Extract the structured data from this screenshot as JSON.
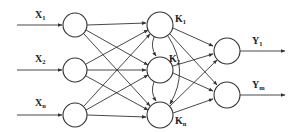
{
  "diagram": {
    "type": "neural-network",
    "colors": {
      "stroke": "#333333",
      "background": "#ffffff",
      "text": "#222222"
    },
    "input_layer": {
      "nodes": [
        {
          "id": "x1",
          "label": "X",
          "sub": "1",
          "cx": 75,
          "cy": 25
        },
        {
          "id": "x2",
          "label": "X",
          "sub": "2",
          "cx": 75,
          "cy": 70
        },
        {
          "id": "xn",
          "label": "X",
          "sub": "n",
          "cx": 75,
          "cy": 115
        }
      ]
    },
    "hidden_layer": {
      "nodes": [
        {
          "id": "k1",
          "label": "K",
          "sub": "1",
          "cx": 160,
          "cy": 25
        },
        {
          "id": "k2",
          "label": "K",
          "sub": "2",
          "cx": 160,
          "cy": 70
        },
        {
          "id": "kn",
          "label": "K",
          "sub": "n",
          "cx": 160,
          "cy": 115
        }
      ]
    },
    "output_layer": {
      "nodes": [
        {
          "id": "y1",
          "label": "Y",
          "sub": "1",
          "cx": 227,
          "cy": 51
        },
        {
          "id": "ym",
          "label": "Y",
          "sub": "m",
          "cx": 227,
          "cy": 95
        }
      ]
    }
  }
}
